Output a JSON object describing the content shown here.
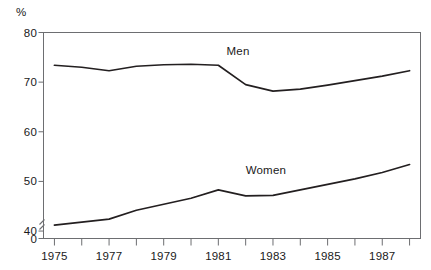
{
  "chart_data": {
    "type": "line",
    "title": "",
    "subtitle": "",
    "xlabel": "",
    "ylabel": "%",
    "ylabel_position": "top-left",
    "x": [
      1975,
      1976,
      1977,
      1978,
      1979,
      1980,
      1981,
      1982,
      1983,
      1984,
      1985,
      1986,
      1987,
      1988
    ],
    "xlim": [
      1974.6,
      1988.4
    ],
    "ylim": [
      38.5,
      80
    ],
    "y_axis_break": true,
    "y_axis_break_label": "0",
    "yticks": [
      80,
      70,
      60,
      50,
      40
    ],
    "ytick_labels": [
      "80",
      "70",
      "60",
      "50",
      "40"
    ],
    "zero_tick_label": "0",
    "xticks": [
      1975,
      1976,
      1977,
      1978,
      1979,
      1980,
      1981,
      1982,
      1983,
      1984,
      1985,
      1986,
      1987,
      1988
    ],
    "xtick_labels": [
      "1975",
      "",
      "1977",
      "",
      "1979",
      "",
      "1981",
      "",
      "1983",
      "",
      "1985",
      "",
      "1987",
      ""
    ],
    "grid": false,
    "legend": "inline-annotations",
    "line_color": "#231f20",
    "frame_color": "#6d6e71",
    "series": [
      {
        "name": "Men",
        "label": "Men",
        "label_x": 1981.3,
        "label_y": 76.2,
        "values": [
          73.4,
          73.0,
          72.3,
          73.2,
          73.5,
          73.6,
          73.4,
          69.5,
          68.2,
          68.6,
          69.4,
          70.3,
          71.2,
          72.3
        ]
      },
      {
        "name": "Women",
        "label": "Women",
        "label_x": 1982.0,
        "label_y": 52.3,
        "values": [
          41.2,
          41.8,
          42.4,
          44.2,
          45.4,
          46.6,
          48.3,
          47.1,
          47.2,
          48.3,
          49.4,
          50.5,
          51.8,
          53.4
        ]
      }
    ]
  }
}
